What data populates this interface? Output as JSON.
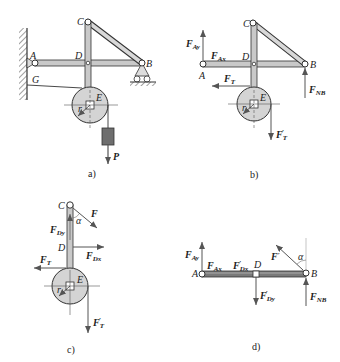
{
  "figure": {
    "panels": [
      {
        "id": "a",
        "caption": "a)",
        "points": {
          "A": "A",
          "B": "B",
          "C": "C",
          "D": "D",
          "E": "E",
          "G": "G"
        },
        "loads": {
          "P": "P"
        },
        "radius_label": "r"
      },
      {
        "id": "b",
        "caption": "b)",
        "points": {
          "A": "A",
          "B": "B",
          "C": "C",
          "D": "D",
          "E": "E"
        },
        "forces": {
          "FAy": {
            "main": "F",
            "sub": "Ay"
          },
          "FAx": {
            "main": "F",
            "sub": "Ax"
          },
          "FT": {
            "main": "F",
            "sub": "T"
          },
          "FT_prime": {
            "main": "F",
            "sub": "T",
            "prime": "′"
          },
          "FNB": {
            "main": "F",
            "sub": "NB"
          }
        },
        "radius_label": "r"
      },
      {
        "id": "c",
        "caption": "c)",
        "points": {
          "C": "C",
          "D": "D",
          "E": "E"
        },
        "forces": {
          "F": {
            "main": "F"
          },
          "FDy": {
            "main": "F",
            "sub": "Dy"
          },
          "FDx": {
            "main": "F",
            "sub": "Dx"
          },
          "FT": {
            "main": "F",
            "sub": "T"
          },
          "FT_prime": {
            "main": "F",
            "sub": "T",
            "prime": "′"
          }
        },
        "angle": "α",
        "radius_label": "r"
      },
      {
        "id": "d",
        "caption": "d)",
        "points": {
          "A": "A",
          "B": "B",
          "D": "D"
        },
        "forces": {
          "FAy": {
            "main": "F",
            "sub": "Ay"
          },
          "FAx": {
            "main": "F",
            "sub": "Ax"
          },
          "FDx_prime": {
            "main": "F",
            "sub": "Dx",
            "prime": "′"
          },
          "FDy_prime": {
            "main": "F",
            "sub": "Dy",
            "prime": "′"
          },
          "F_prime": {
            "main": "F",
            "prime": "′"
          },
          "FNB": {
            "main": "F",
            "sub": "NB"
          }
        },
        "angle": "α"
      }
    ],
    "colors": {
      "bar_fill": "#c9c9c9",
      "bar_stroke": "#333333",
      "pulley_fill": "#d4d4d4",
      "weight_fill": "#6e6e6e",
      "arrow": "#555555",
      "text": "#222222"
    }
  }
}
